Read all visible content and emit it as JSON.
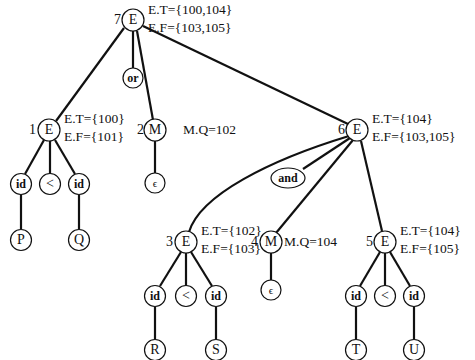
{
  "diagram": {
    "type": "annotated parse tree",
    "nodes": {
      "e7": {
        "index": "7",
        "symbol": "E",
        "attr_t": "E.T={100,104}",
        "attr_f": "E.F={103,105}"
      },
      "or": {
        "symbol": "or"
      },
      "e1": {
        "index": "1",
        "symbol": "E",
        "attr_t": "E.T={100}",
        "attr_f": "E.F={101}"
      },
      "m2": {
        "index": "2",
        "symbol": "M",
        "attr_q": "M.Q=102"
      },
      "e6": {
        "index": "6",
        "symbol": "E",
        "attr_t": "E.T={104}",
        "attr_f": "E.F={103,105}"
      },
      "and": {
        "symbol": "and"
      },
      "e3": {
        "index": "3",
        "symbol": "E",
        "attr_t": "E.T={102}",
        "attr_f": "E.F={103}"
      },
      "m4": {
        "index": "4",
        "symbol": "M",
        "attr_q": "M.Q=104"
      },
      "e5": {
        "index": "5",
        "symbol": "E",
        "attr_t": "E.T={104}",
        "attr_f": "E.F={105}"
      },
      "e1_children": [
        "id",
        "<",
        "id"
      ],
      "e1_leaves": [
        "P",
        "Q"
      ],
      "e3_children": [
        "id",
        "<",
        "id"
      ],
      "e3_leaves": [
        "R",
        "S"
      ],
      "e5_children": [
        "id",
        "<",
        "id"
      ],
      "e5_leaves": [
        "T",
        "U"
      ],
      "epsilon": "ϵ"
    }
  }
}
